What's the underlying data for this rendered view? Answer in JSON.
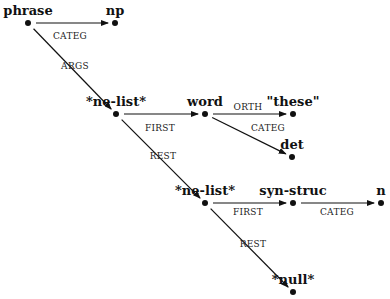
{
  "diagram": {
    "type": "feature-structure-graph",
    "nodes": [
      {
        "id": "phrase",
        "label": "phrase",
        "x": 28,
        "y": 23
      },
      {
        "id": "np",
        "label": "np",
        "x": 115,
        "y": 23
      },
      {
        "id": "nelist1",
        "label": "*ne-list*",
        "x": 116,
        "y": 114
      },
      {
        "id": "word",
        "label": "word",
        "x": 205,
        "y": 114
      },
      {
        "id": "these",
        "label": "\"these\"",
        "x": 293,
        "y": 114
      },
      {
        "id": "det",
        "label": "det",
        "x": 292,
        "y": 157
      },
      {
        "id": "nelist2",
        "label": "*ne-list*",
        "x": 205,
        "y": 203
      },
      {
        "id": "synstruc",
        "label": "syn-struc",
        "x": 293,
        "y": 203
      },
      {
        "id": "n",
        "label": "n",
        "x": 381,
        "y": 203
      },
      {
        "id": "null",
        "label": "*null*",
        "x": 293,
        "y": 292
      }
    ],
    "edges": [
      {
        "from": "phrase",
        "to": "np",
        "label": "CATEG",
        "lx": 70,
        "ly": 37
      },
      {
        "from": "phrase",
        "to": "nelist1",
        "label": "ARGS",
        "lx": 75,
        "ly": 67
      },
      {
        "from": "nelist1",
        "to": "word",
        "label": "FIRST",
        "lx": 160,
        "ly": 129
      },
      {
        "from": "word",
        "to": "these",
        "label": "ORTH",
        "lx": 248,
        "ly": 108
      },
      {
        "from": "word",
        "to": "det",
        "label": "CATEG",
        "lx": 268,
        "ly": 129
      },
      {
        "from": "nelist1",
        "to": "nelist2",
        "label": "REST",
        "lx": 163,
        "ly": 157
      },
      {
        "from": "nelist2",
        "to": "synstruc",
        "label": "FIRST",
        "lx": 248,
        "ly": 213
      },
      {
        "from": "synstruc",
        "to": "n",
        "label": "CATEG",
        "lx": 337,
        "ly": 213
      },
      {
        "from": "nelist2",
        "to": "null",
        "label": "REST",
        "lx": 253,
        "ly": 245
      }
    ]
  }
}
